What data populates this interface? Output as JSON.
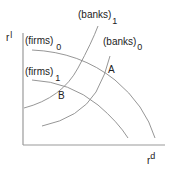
{
  "diagram": {
    "type": "economics-curve-diagram",
    "axes": {
      "y_label": "r",
      "y_label_sup": "l",
      "x_label": "r",
      "x_label_sup": "d"
    },
    "curves": [
      {
        "name": "firms",
        "subscript": "0",
        "label": "(firms)",
        "shape": "concave-down"
      },
      {
        "name": "firms",
        "subscript": "1",
        "label": "(firms)",
        "shape": "concave-down"
      },
      {
        "name": "banks",
        "subscript": "1",
        "label": "(banks)",
        "shape": "upward-sloping"
      },
      {
        "name": "banks",
        "subscript": "0",
        "label": "(banks)",
        "shape": "upward-sloping"
      }
    ],
    "points": [
      {
        "label": "A",
        "description": "intersection of (firms)0 and (banks)0"
      },
      {
        "label": "B",
        "description": "intersection of (firms)1 and (banks)1"
      }
    ],
    "colors": {
      "axis": "#9a9a9a",
      "curve": "#8a8a8a",
      "text": "#222222"
    }
  }
}
